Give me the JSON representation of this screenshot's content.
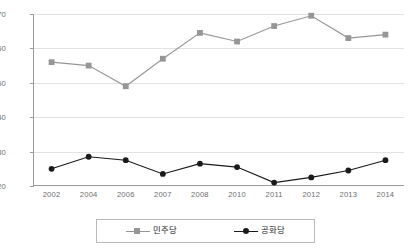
{
  "chart_data": {
    "type": "line",
    "title": "",
    "subtitle": "",
    "xlabel": "",
    "ylabel": "",
    "ylim": [
      20,
      70
    ],
    "yticks": [
      20,
      30,
      40,
      50,
      60,
      70
    ],
    "grid": true,
    "legend_position": "bottom",
    "categories": [
      "2002",
      "2004",
      "2006",
      "2007",
      "2008",
      "2010",
      "2011",
      "2012",
      "2013",
      "2014"
    ],
    "series": [
      {
        "name": "민주당",
        "color": "#969696",
        "marker": "square",
        "values": [
          56,
          55,
          49,
          57,
          64.5,
          62,
          66.5,
          69.5,
          63,
          64
        ]
      },
      {
        "name": "공화당",
        "color": "#1a1a1a",
        "marker": "circle",
        "values": [
          25,
          28.5,
          27.5,
          23.5,
          26.5,
          25.5,
          21,
          22.5,
          24.5,
          27.5
        ]
      }
    ]
  },
  "axes": {
    "y_tick_labels": [
      "20",
      "30",
      "40",
      "50",
      "60",
      "70"
    ],
    "x_tick_labels": [
      "2002",
      "2004",
      "2006",
      "2007",
      "2008",
      "2010",
      "2011",
      "2012",
      "2013",
      "2014"
    ]
  },
  "legend": {
    "items": [
      {
        "label": "민주당",
        "color": "#969696",
        "marker": "square"
      },
      {
        "label": "공화당",
        "color": "#1a1a1a",
        "marker": "circle"
      }
    ]
  },
  "colors": {
    "grid": "#e2e2e2",
    "axis": "#9a9a9a",
    "tick_text": "#6d6d6d",
    "legend_border": "#b8b8b8",
    "background": "#ffffff"
  }
}
